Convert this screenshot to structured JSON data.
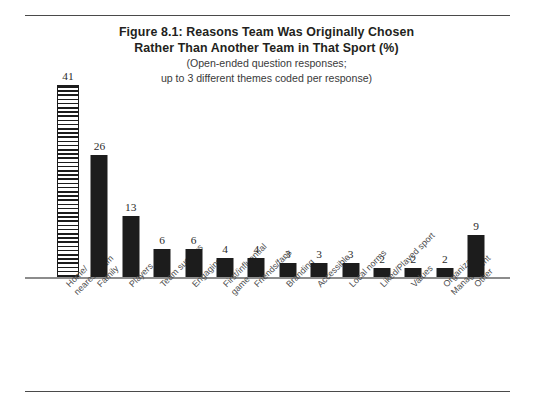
{
  "figure": {
    "title_line_1": "Figure 8.1: Reasons Team Was Originally Chosen",
    "title_line_2": "Rather Than Another Team in That Sport  (%)",
    "subtitle_line_1": "(Open-ended question responses;",
    "subtitle_line_2": "up to 3 different themes coded per response)"
  },
  "colors": {
    "bar_fill": "#1c1c1c",
    "bar_hatched_fill": "#1c1c1c",
    "baseline": "#8c8c8c",
    "rule": "#4a4a4a",
    "title_text": "#231f20",
    "label_text": "#4d4d4d",
    "background": "#ffffff"
  },
  "chart_data": {
    "type": "bar",
    "title": "Figure 8.1: Reasons Team Was Originally Chosen Rather Than Another Team in That Sport  (%)",
    "subtitle": "(Open-ended question responses; up to 3 different themes coded per response)",
    "xlabel": "",
    "ylabel": "",
    "ylim": [
      0,
      41
    ],
    "grid": false,
    "legend": "none",
    "value_labels": true,
    "categories": [
      "Home/ nearest team",
      "Family",
      "Players",
      "Team success",
      "Engaging",
      "First/influential game",
      "Friends/fans",
      "Branding",
      "Accessible",
      "Local norms",
      "Liked/Played sport",
      "Values",
      "Organization/ Management",
      "Other"
    ],
    "category_lines": [
      [
        "Home/",
        "nearest team"
      ],
      [
        "Family",
        ""
      ],
      [
        "Players",
        ""
      ],
      [
        "Team success",
        ""
      ],
      [
        "Engaging",
        ""
      ],
      [
        "First/influential",
        "game"
      ],
      [
        "Friends/fans",
        ""
      ],
      [
        "Branding",
        ""
      ],
      [
        "Accessible",
        ""
      ],
      [
        "Local norms",
        ""
      ],
      [
        "Liked/Played sport",
        ""
      ],
      [
        "Values",
        ""
      ],
      [
        "Organization/",
        "Management"
      ],
      [
        "Other",
        ""
      ]
    ],
    "values": [
      41,
      26,
      13,
      6,
      6,
      4,
      4,
      3,
      3,
      3,
      2,
      2,
      2,
      9
    ],
    "bar_styles": [
      "hatched",
      "solid",
      "solid",
      "solid",
      "solid",
      "solid",
      "solid",
      "solid",
      "solid",
      "solid",
      "solid",
      "solid",
      "solid",
      "solid"
    ]
  }
}
